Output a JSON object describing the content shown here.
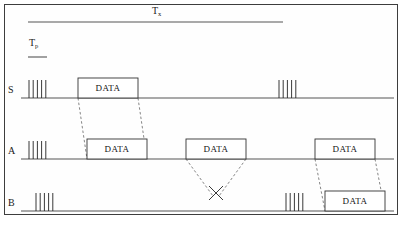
{
  "figure": {
    "kind": "protocol-timing-diagram",
    "caption": "",
    "colors": {
      "border": "#3d3d3d",
      "baseline": "#555555",
      "pulse": "#222222",
      "box_stroke": "#333333",
      "dashed": "#777777",
      "text": "#1a1a1a",
      "background": "#ffffff"
    }
  },
  "spans": [
    {
      "id": "tx",
      "label_base": "T",
      "label_sub": "x",
      "label_full": "Tx",
      "label_x": 152,
      "label_y": 6,
      "line_x1": 28,
      "line_x2": 283,
      "line_y": 22
    },
    {
      "id": "tp",
      "label_base": "T",
      "label_sub": "p",
      "label_full": "Tp",
      "label_x": 29,
      "label_y": 38,
      "line_x1": 28,
      "line_x2": 47,
      "line_y": 57
    }
  ],
  "rows": [
    {
      "id": "s",
      "label": "S",
      "label_x": 8,
      "label_y": 85,
      "baseline_y": 98,
      "baseline_x1": 21,
      "baseline_x2": 394
    },
    {
      "id": "a",
      "label": "A",
      "label_x": 8,
      "label_y": 146,
      "baseline_y": 159,
      "baseline_x1": 21,
      "baseline_x2": 394
    },
    {
      "id": "b",
      "label": "B",
      "label_x": 8,
      "label_y": 198,
      "baseline_y": 211,
      "baseline_x1": 21,
      "baseline_x2": 394
    }
  ],
  "pulse_trains": [
    {
      "row": "s",
      "count": 5,
      "x_start": 29,
      "spacing": 4.2,
      "height": 18
    },
    {
      "row": "s",
      "count": 5,
      "x_start": 279,
      "spacing": 4.2,
      "height": 18
    },
    {
      "row": "a",
      "count": 5,
      "x_start": 29,
      "spacing": 4.2,
      "height": 18
    },
    {
      "row": "b",
      "count": 5,
      "x_start": 36,
      "spacing": 4.2,
      "height": 18
    },
    {
      "row": "b",
      "count": 5,
      "x_start": 286,
      "spacing": 4.2,
      "height": 18
    }
  ],
  "data_packets": [
    {
      "id": "s-data-1",
      "row": "s",
      "label": "DATA",
      "x1": 78,
      "x2": 138,
      "height": 20
    },
    {
      "id": "a-data-1",
      "row": "a",
      "label": "DATA",
      "x1": 87,
      "x2": 147,
      "height": 20
    },
    {
      "id": "a-data-2",
      "row": "a",
      "label": "DATA",
      "x1": 186,
      "x2": 246,
      "height": 20
    },
    {
      "id": "a-data-3",
      "row": "a",
      "label": "DATA",
      "x1": 315,
      "x2": 375,
      "height": 20
    },
    {
      "id": "b-data-1",
      "row": "b",
      "label": "DATA",
      "x1": 325,
      "x2": 385,
      "height": 20
    }
  ],
  "propagation_links": [
    {
      "id": "link-s1-a1-left",
      "x1": 78,
      "y1": 98,
      "x2": 87,
      "y2": 159
    },
    {
      "id": "link-s1-a1-right",
      "x1": 138,
      "y1": 98,
      "x2": 147,
      "y2": 159
    },
    {
      "id": "link-a3-b1-left",
      "x1": 315,
      "y1": 159,
      "x2": 325,
      "y2": 211
    },
    {
      "id": "link-a3-b1-right",
      "x1": 375,
      "y1": 159,
      "x2": 385,
      "y2": 211
    }
  ],
  "collision": {
    "id": "collision-marker",
    "label": "",
    "left_x1": 186,
    "left_y1": 159,
    "left_x2": 213,
    "left_y2": 196,
    "right_x1": 246,
    "right_y1": 159,
    "right_x2": 219,
    "right_y2": 196,
    "cross_cx": 216,
    "cross_cy": 193,
    "cross_size": 7
  }
}
